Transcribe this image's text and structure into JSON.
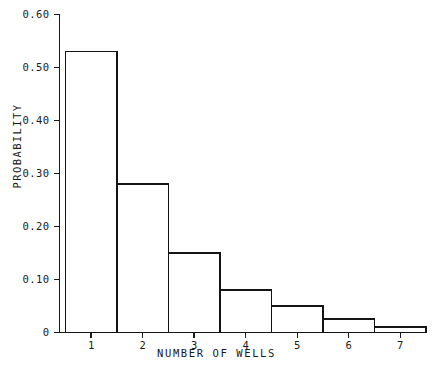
{
  "chart_data": {
    "type": "bar",
    "title": "",
    "subtitle": "",
    "xlabel": "NUMBER OF WELLS",
    "ylabel": "PROBABILITY",
    "categories": [
      "1",
      "2",
      "3",
      "4",
      "5",
      "6",
      "7"
    ],
    "values": [
      0.53,
      0.28,
      0.15,
      0.08,
      0.05,
      0.025,
      0.01
    ],
    "series": [
      {
        "name": "Probability",
        "values": [
          0.53,
          0.28,
          0.15,
          0.08,
          0.05,
          0.025,
          0.01
        ]
      }
    ],
    "xlim": [
      0.5,
      7.5
    ],
    "ylim": [
      0,
      0.6
    ],
    "ytick_labels": [
      "0.60",
      "0.50",
      "0.40",
      "0.30",
      "0.20",
      "0.10",
      "0"
    ],
    "ytick_values": [
      0.6,
      0.5,
      0.4,
      0.3,
      0.2,
      0.1,
      0
    ],
    "xtick_labels": [
      "1",
      "2",
      "3",
      "4",
      "5",
      "6",
      "7"
    ],
    "grid": false,
    "legend": false,
    "legend_position": "none",
    "bar_style": "open-outline-histogram",
    "colors": {
      "background": "#ffffff",
      "bar_fill": "#ffffff",
      "bar_edge": "#141414",
      "axis": "#1a1a1a",
      "text": "#1a1a1a"
    }
  }
}
